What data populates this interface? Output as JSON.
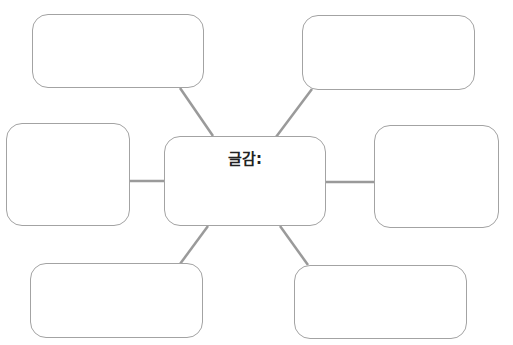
{
  "diagram": {
    "type": "spider-map",
    "center": {
      "label": "글감:"
    },
    "branches": [
      {
        "position": "top-left",
        "label": ""
      },
      {
        "position": "top-right",
        "label": ""
      },
      {
        "position": "left",
        "label": ""
      },
      {
        "position": "right",
        "label": ""
      },
      {
        "position": "bottom-left",
        "label": ""
      },
      {
        "position": "bottom-right",
        "label": ""
      }
    ],
    "colors": {
      "border": "#a3a3a3",
      "connector": "#9a9a9a",
      "text": "#222222"
    }
  }
}
